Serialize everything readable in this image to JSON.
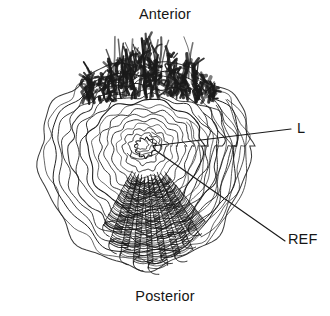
{
  "figure": {
    "kind": "anatomical-line-drawing",
    "title_top": "Anterior",
    "title_bottom": "Posterior",
    "background_color": "#ffffff",
    "ink_color": "#1a1a1a"
  },
  "labels": {
    "anterior": "Anterior",
    "posterior": "Posterior",
    "l": "L",
    "ref": "REF"
  },
  "leaders": [
    {
      "name": "leader-l",
      "label": "L",
      "from_x": 152,
      "from_y": 146,
      "to_x": 291,
      "to_y": 129
    },
    {
      "name": "leader-ref",
      "label": "REF",
      "from_x": 155,
      "from_y": 150,
      "to_x": 285,
      "to_y": 241
    }
  ],
  "structures": {
    "dome": {
      "name": "concentric-ridge-dome",
      "center_x": 145,
      "center_y": 146,
      "left_edge_x": 24,
      "right_edge_x": 259,
      "top_edge_y": 60,
      "bottom_edge_y": 271,
      "ring_count": 17
    },
    "apical_tuft": {
      "name": "dark-fibrous-tuft",
      "x_min": 85,
      "x_max": 216,
      "y_min": 37,
      "y_max": 106,
      "tuft_count": 46
    },
    "radiating_folds": {
      "name": "radiating-coiled-folds",
      "count": 9,
      "origin_x": 145,
      "origin_y": 150,
      "angle_start_deg": 108,
      "angle_end_deg": 62,
      "inner_radius": 32,
      "outer_radius": 132
    }
  }
}
